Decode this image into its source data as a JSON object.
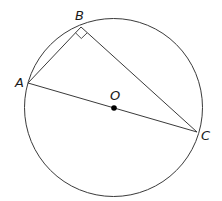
{
  "diagram": {
    "type": "inscribed right triangle in circle",
    "circle": {
      "center_label": "O",
      "cx": 113.5,
      "cy": 107.5,
      "r": 89
    },
    "points": [
      {
        "label": "A",
        "x": 28,
        "y": 83,
        "label_x": 15,
        "label_y": 87
      },
      {
        "label": "B",
        "x": 81,
        "y": 27,
        "label_x": 74,
        "label_y": 19
      },
      {
        "label": "C",
        "x": 197,
        "y": 132,
        "label_x": 201,
        "label_y": 140
      },
      {
        "label": "O",
        "x": 114,
        "y": 108,
        "label_x": 109,
        "label_y": 100
      }
    ],
    "segments": [
      "AB",
      "BC",
      "AC"
    ],
    "right_angle_at": "B",
    "colors": {
      "stroke": "#3a3a3a",
      "dot": "#000000",
      "label": "#1a1a1a"
    }
  }
}
